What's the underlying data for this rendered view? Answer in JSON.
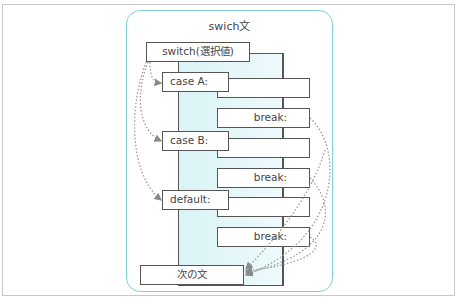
{
  "diagram": {
    "title": "swich文",
    "switch_label": "switch(選択値)",
    "cases": [
      {
        "label": "case A:",
        "break_label": "break:"
      },
      {
        "label": "case B:",
        "break_label": "break:"
      },
      {
        "label": "default:",
        "break_label": "break:"
      }
    ],
    "next_statement": "次の文",
    "colors": {
      "container_border": "#7fd3d6",
      "panel_fill": "#dff5f7",
      "box_border": "#555555",
      "arrow": "#9a9a9a"
    }
  }
}
